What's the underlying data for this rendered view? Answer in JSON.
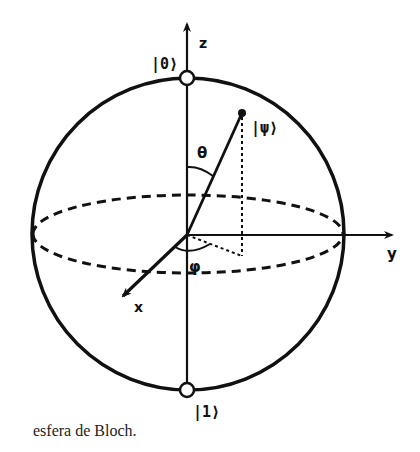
{
  "diagram": {
    "axes": {
      "z_label": "z",
      "y_label": "y",
      "x_label": "x"
    },
    "states": {
      "north_label": "|0⟩",
      "south_label": "|1⟩",
      "psi_label": "|ψ⟩"
    },
    "angles": {
      "theta_label": "θ",
      "phi_label": "φ"
    },
    "colors": {
      "stroke": "#111111",
      "background": "#ffffff"
    }
  },
  "caption": "esfera de Bloch."
}
